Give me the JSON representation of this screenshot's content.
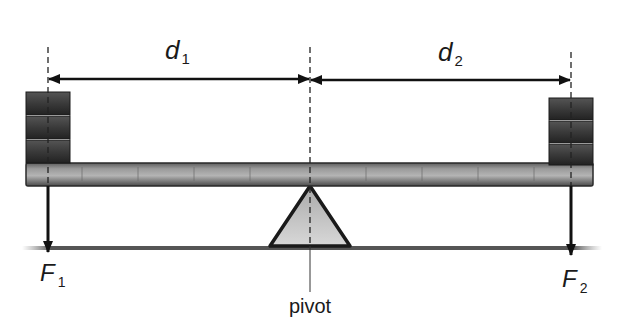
{
  "diagram": {
    "labels": {
      "d1": {
        "main": "d",
        "sub": "1"
      },
      "d2": {
        "main": "d",
        "sub": "2"
      },
      "F1": {
        "main": "F",
        "sub": "1"
      },
      "F2": {
        "main": "F",
        "sub": "2"
      },
      "pivot": "pivot"
    },
    "components": {
      "left_weight_blocks": 3,
      "right_weight_blocks": 3
    },
    "colors": {
      "ink": "#1a1a1a",
      "weight": "#3a3a3a",
      "beam": "#8a8a8a",
      "fulcrum_fill": "#c8c8c8"
    }
  }
}
